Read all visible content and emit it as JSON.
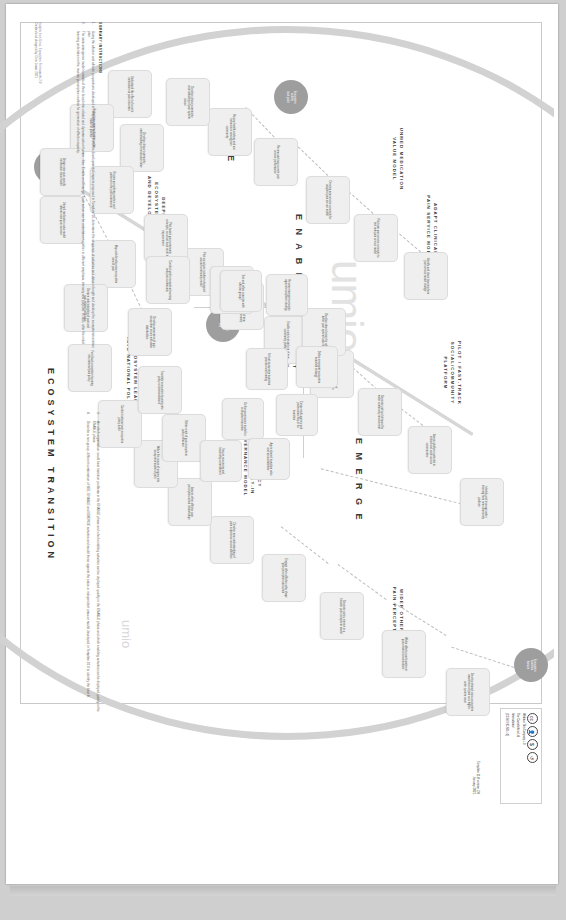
{
  "poster": {
    "axis_label": "ECOSYSTEM TRANSITION",
    "brand": "umio",
    "phases": [
      {
        "id": "see",
        "label": "S E E"
      },
      {
        "id": "enable",
        "label": "E N A B L E"
      },
      {
        "id": "emerge",
        "label": "E M E R G E"
      }
    ],
    "streams": [
      {
        "id": "wider-other",
        "label": "WIDER OTHER AFFECTOR\nPAIN PERCEPTION-ACTION"
      },
      {
        "id": "pilot",
        "label": "PILOT / FAST-TRACK\nSOCIAL/COMMUNITY\nPLATFORM"
      },
      {
        "id": "adapt",
        "label": "ADAPT CLINICAL\nPAIN SERVICE MODEL"
      },
      {
        "id": "unmed",
        "label": "UNMED MEDICATION\nVALUE MODEL"
      },
      {
        "id": "deepen",
        "label": "DEEPEN PAIN\nECOSYSTEM LEARNING\nAND DEVELOP AWARENESS"
      },
      {
        "id": "feed-policy",
        "label": "FEED ECOSYSTEM LEARNING\nINTO NATIONAL POLICY"
      },
      {
        "id": "review",
        "label": "REVIEW\nCONCEPTS"
      },
      {
        "id": "define",
        "label": "DEFINE\nEMERGENT\nSTRATEGY"
      },
      {
        "id": "governance",
        "label": "CREATE MULTI-AGENCY\nAND PROFESSIONAL BUY-IN\nDEFINE GOVERNANCE MODEL"
      }
    ],
    "hubs": [
      {
        "id": "hub-top-right",
        "label": "Ecosystem\ntransition\nhorizon"
      },
      {
        "id": "hub-mid-left",
        "label": "Ecosystem\nactivity\nstart point"
      },
      {
        "id": "hub-center",
        "label": "Emergent\nstrategy\nhub"
      },
      {
        "id": "hub-bottom-left",
        "label": "Ecosystem\nlearning\nstart point"
      }
    ],
    "nodes": [
      {
        "id": "n1",
        "stream": "wider-other",
        "text": "Develop shared cross-ecosystem awareness of pain as a higher-order system issue"
      },
      {
        "id": "n2",
        "stream": "wider-other",
        "text": "Widen affector participation in pain-related conversations"
      },
      {
        "id": "n3",
        "stream": "wider-other",
        "text": "Generate policy interest in a broader pain ecosystem model"
      },
      {
        "id": "n4",
        "stream": "wider-other",
        "text": "Engage other affectors who shape pain perception and action"
      },
      {
        "id": "n5",
        "stream": "wider-other",
        "text": "Develop new understanding of pain experience across affectors"
      },
      {
        "id": "n6",
        "stream": "wider-other",
        "text": "Assess other affector pain perception-action relationships"
      },
      {
        "id": "n7",
        "stream": "wider-other",
        "text": "Widen the scope of enquiry into ecosystem model of pain"
      },
      {
        "id": "n8",
        "stream": "pilot",
        "text": "Identify and leverage wider learning from new community platform"
      },
      {
        "id": "n9",
        "stream": "pilot",
        "text": "Assess platform potential to embed and scale across communities"
      },
      {
        "id": "n10",
        "stream": "pilot",
        "text": "Generate pull and demand for wider community involvement"
      },
      {
        "id": "n11",
        "stream": "pilot",
        "text": "Increase size and role of community platform in pain support"
      },
      {
        "id": "n12",
        "stream": "pilot",
        "text": "Enable early test and run of new community platform"
      },
      {
        "id": "n13",
        "stream": "pilot",
        "text": "Communicate value of new platform to wider community"
      },
      {
        "id": "n14",
        "stream": "pilot",
        "text": "Pilot social-peer platform designed around community needs"
      },
      {
        "id": "n15",
        "stream": "pilot",
        "text": "Pilot based pain community concepts, as a fast-track route to improvement"
      },
      {
        "id": "n16",
        "stream": "adapt",
        "text": "Identify and share learning from pain service model change"
      },
      {
        "id": "n17",
        "stream": "adapt",
        "text": "Pilot new pain service concepts to test new pain service model"
      },
      {
        "id": "n18",
        "stream": "adapt",
        "text": "Develop new service concepts for adapted pain service model"
      },
      {
        "id": "n19",
        "stream": "adapt",
        "text": "Review and map current pain service performance"
      },
      {
        "id": "n20",
        "stream": "adapt",
        "text": "Review health-seeking and use behaviours among pain community"
      },
      {
        "id": "n21",
        "stream": "adapt",
        "text": "Develop clinical community understanding of pain system issues"
      },
      {
        "id": "n22",
        "stream": "unmed",
        "text": "Develop clinical community understanding of medication value"
      },
      {
        "id": "n23",
        "stream": "unmed",
        "text": "Review prescribing practice and patterns in the pain community"
      },
      {
        "id": "n24",
        "stream": "unmed",
        "text": "Understand the effect of current medication on pain outcomes"
      },
      {
        "id": "n25",
        "stream": "unmed",
        "text": "Embed new non-medication value model in practice"
      },
      {
        "id": "n26",
        "stream": "unmed",
        "text": "Design new pain-specific medication value model"
      },
      {
        "id": "n27",
        "stream": "unmed",
        "text": "Unmed medication value model informs new pain services"
      },
      {
        "id": "n28",
        "stream": "deepen",
        "text": "Map and develop new ecosystem view of pain"
      },
      {
        "id": "n29",
        "stream": "deepen",
        "text": "Deepen understanding of pain and pain-related behaviour"
      },
      {
        "id": "n30",
        "stream": "deepen",
        "text": "Conduct wider ecosystem learning with pain community"
      },
      {
        "id": "n31",
        "stream": "deepen",
        "text": "Develop awareness of pain ecosystem issues with wider stakeholders"
      },
      {
        "id": "n32",
        "stream": "deepen",
        "text": "Develop shared vision for what a better pain system looks like"
      },
      {
        "id": "n33",
        "stream": "deepen",
        "text": "Review pain-related outcomes and performance gaps"
      },
      {
        "id": "n34",
        "stream": "feed-policy",
        "text": "Feed back ecosystem learning into national pain policy"
      },
      {
        "id": "n35",
        "stream": "feed-policy",
        "text": "Conduct national pain ecosystem policy audit"
      },
      {
        "id": "n36",
        "stream": "feed-policy",
        "text": "Translate ecosystem learning into policy recommendations"
      },
      {
        "id": "n37",
        "stream": "feed-policy",
        "text": "Define remit of pain ecosystem policy influence"
      },
      {
        "id": "n38",
        "stream": "review",
        "text": "Review emergent concepts against ecosystem strategy"
      },
      {
        "id": "n39",
        "stream": "review",
        "text": "Test and refine concepts with affector groups"
      },
      {
        "id": "n40",
        "stream": "define",
        "text": "Define emergent ecosystem transition strategy"
      },
      {
        "id": "n41",
        "stream": "define",
        "text": "Set out ecosystem transition priorities and funding"
      },
      {
        "id": "n42",
        "stream": "governance",
        "text": "Create multi-agency and professional buy-in for transition"
      },
      {
        "id": "n43",
        "stream": "governance",
        "text": "Define governance model for ecosystem transition"
      },
      {
        "id": "n44",
        "stream": "governance",
        "text": "Agree shared transition roles and accountabilities"
      },
      {
        "id": "n45",
        "stream": "governance",
        "text": "Secure resourcing and leadership commitment"
      }
    ]
  },
  "instructions": {
    "heading": "SUMMARY INSTRUCTIONS",
    "items": [
      "Using the affector and affector propositions developed in Templates 8.0 and 9.0 and the developmental impacts proposed in Template 10, determine the sequence of activities and dates in length and develop the ecosystem transition plan.",
      "The semi-emergence model consists of three broad inter-related and dynamic action frames - See, Enable and Emerge. Each action can be undertaken together in different emphasis, intensity and purpose. In SEE, after the initial learning undertaken in the reverse prescriptive realities for generation of affector capacity.",
      "An which organisation would best transition problems in the ENABLE phase and which enabling activities can be deployed quickly in the ENABLE phase and which enabling activities can be deployed quickly in the ENABLE phase.",
      "Describe a non-group, different combination of SEE, ENABLE and EMERGE activities and model these against the value or independent umio/on model developed in Template 10.0 to identify the best fit."
    ]
  },
  "license": {
    "icons": [
      "cc-icon",
      "by-icon",
      "nc-icon",
      "sa-icon"
    ],
    "holder": "Webinar Thin Company 4.0",
    "lines": [
      "Webinar Thin Company 4.0",
      "The Carnelletters Ltd",
      "International",
      "(CC BY-NC-ND 4.0)"
    ],
    "template": "Template 11.0 version 2.0\nJanuary 2021"
  },
  "credits": {
    "line1": "Insights from Umio, Ecosystem Frameworks 2.0",
    "line2": "Created and designed by Chris Lawer 2021"
  }
}
